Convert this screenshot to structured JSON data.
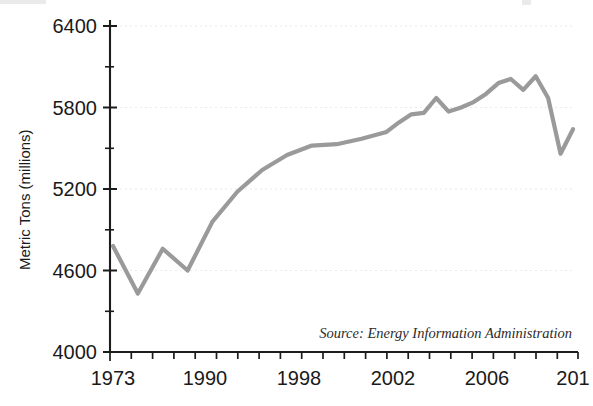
{
  "chart_data": {
    "type": "line",
    "title": "",
    "xlabel": "",
    "ylabel": "Metric Tons (millions)",
    "source_note": "Source: Energy Information Administration",
    "ylim": [
      4000,
      6400
    ],
    "ytick_labels": [
      "6400",
      "5800",
      "5200",
      "4600",
      "4000"
    ],
    "ytick_values": [
      6400,
      5800,
      5200,
      4600,
      4000
    ],
    "ytick_minor_values": [
      6100,
      5500,
      4900,
      4300
    ],
    "xtick_labels": [
      "1973",
      "1990",
      "1998",
      "2002",
      "2006",
      "201"
    ],
    "xtick_label_years": [
      1973,
      1990,
      1998,
      2002,
      2006,
      2010
    ],
    "xlim": [
      1973,
      2010
    ],
    "grid": true,
    "legend": "none",
    "series_color": "#9a9a9a",
    "series": [
      {
        "name": "Carbon dioxide emissions",
        "x": [
          1973,
          1975,
          1977,
          1979,
          1981,
          1983,
          1985,
          1987,
          1989,
          1991,
          1993,
          1995,
          1996,
          1997,
          1998,
          1999,
          2000,
          2001,
          2002,
          2003,
          2004,
          2005,
          2006,
          2007,
          2008,
          2009,
          2010
        ],
        "values": [
          4780,
          4430,
          4760,
          4600,
          4960,
          5180,
          5340,
          5450,
          5520,
          5530,
          5570,
          5620,
          5690,
          5750,
          5760,
          5870,
          5770,
          5800,
          5840,
          5900,
          5980,
          6010,
          5930,
          6030,
          5870,
          5460,
          5640
        ]
      }
    ]
  }
}
